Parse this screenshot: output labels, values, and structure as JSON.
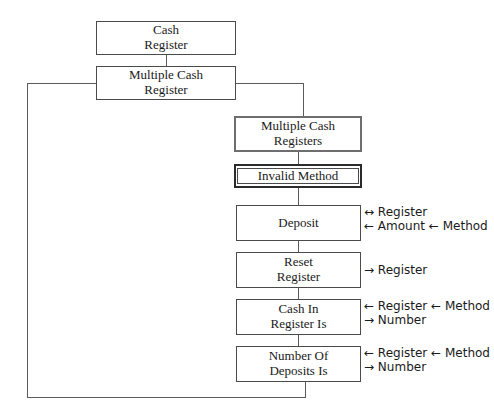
{
  "diagram": {
    "type": "structure-chart",
    "background_color": "#ffffff",
    "line_color": "#5b5b5b",
    "text_color": "#1a1a1a"
  },
  "nodes": [
    {
      "id": "cash-register",
      "line1": "Cash",
      "line2": "Register",
      "border_style": "plain",
      "x": 96,
      "y": 21,
      "w": 140,
      "h": 34,
      "font_size": 13
    },
    {
      "id": "multiple-cash-register",
      "line1": "Multiple Cash",
      "line2": "Register",
      "border_style": "plain",
      "x": 96,
      "y": 66,
      "w": 140,
      "h": 34,
      "font_size": 13
    },
    {
      "id": "multiple-cash-registers",
      "line1": "Multiple Cash",
      "line2": "Registers",
      "border_style": "thick",
      "x": 234,
      "y": 116,
      "w": 128,
      "h": 36,
      "font_size": 13
    },
    {
      "id": "invalid-method",
      "line1": "Invalid Method",
      "line2": "",
      "border_style": "double",
      "x": 234,
      "y": 164,
      "w": 128,
      "h": 24,
      "font_size": 13
    },
    {
      "id": "deposit",
      "line1": "Deposit",
      "line2": "",
      "border_style": "plain",
      "x": 236,
      "y": 205,
      "w": 125,
      "h": 36,
      "font_size": 13
    },
    {
      "id": "reset-register",
      "line1": "Reset",
      "line2": "Register",
      "border_style": "plain",
      "x": 236,
      "y": 252,
      "w": 125,
      "h": 36,
      "font_size": 13
    },
    {
      "id": "cash-in-register-is",
      "line1": "Cash In",
      "line2": "Register Is",
      "border_style": "plain",
      "x": 236,
      "y": 299,
      "w": 125,
      "h": 36,
      "font_size": 13
    },
    {
      "id": "number-of-deposits-is",
      "line1": "Number Of",
      "line2": "Deposits Is",
      "border_style": "plain",
      "x": 236,
      "y": 346,
      "w": 125,
      "h": 36,
      "font_size": 13
    }
  ],
  "annotations": [
    {
      "id": "deposit-annot",
      "for": "deposit",
      "rows": [
        "↔ Register",
        "← Amount ← Method"
      ],
      "x": 364,
      "y": 206,
      "font_size": 12
    },
    {
      "id": "reset-register-annot",
      "for": "reset-register",
      "rows": [
        "→ Register"
      ],
      "x": 364,
      "y": 264,
      "font_size": 12
    },
    {
      "id": "cash-in-register-is-annot",
      "for": "cash-in-register-is",
      "rows": [
        "← Register ← Method",
        "→ Number"
      ],
      "x": 364,
      "y": 300,
      "font_size": 12
    },
    {
      "id": "number-of-deposits-is-annot",
      "for": "number-of-deposits-is",
      "rows": [
        "← Register ← Method",
        "→ Number"
      ],
      "x": 364,
      "y": 347,
      "font_size": 12
    }
  ],
  "connectors": [
    {
      "id": "cash-to-multiple",
      "orient": "v",
      "x": 166,
      "y": 55,
      "len": 11
    },
    {
      "id": "mcr-right-stub",
      "orient": "h",
      "x": 236,
      "y": 83,
      "len": 67
    },
    {
      "id": "mcr-right-down",
      "orient": "v",
      "x": 303,
      "y": 83,
      "len": 33
    },
    {
      "id": "mcrs-to-invalid",
      "orient": "v",
      "x": 298,
      "y": 152,
      "len": 12
    },
    {
      "id": "invalid-to-deposit",
      "orient": "v",
      "x": 298,
      "y": 188,
      "len": 17
    },
    {
      "id": "deposit-to-reset",
      "orient": "v",
      "x": 298,
      "y": 241,
      "len": 11
    },
    {
      "id": "reset-to-cashin",
      "orient": "v",
      "x": 298,
      "y": 288,
      "len": 11
    },
    {
      "id": "cashin-to-numdep",
      "orient": "v",
      "x": 298,
      "y": 335,
      "len": 11
    },
    {
      "id": "numdep-down",
      "orient": "v",
      "x": 305,
      "y": 382,
      "len": 16
    },
    {
      "id": "return-bottom",
      "orient": "h",
      "x": 27,
      "y": 397,
      "len": 279
    },
    {
      "id": "return-left",
      "orient": "v",
      "x": 27,
      "y": 83,
      "len": 315
    },
    {
      "id": "mcr-left-stub",
      "orient": "h",
      "x": 27,
      "y": 83,
      "len": 70
    }
  ]
}
